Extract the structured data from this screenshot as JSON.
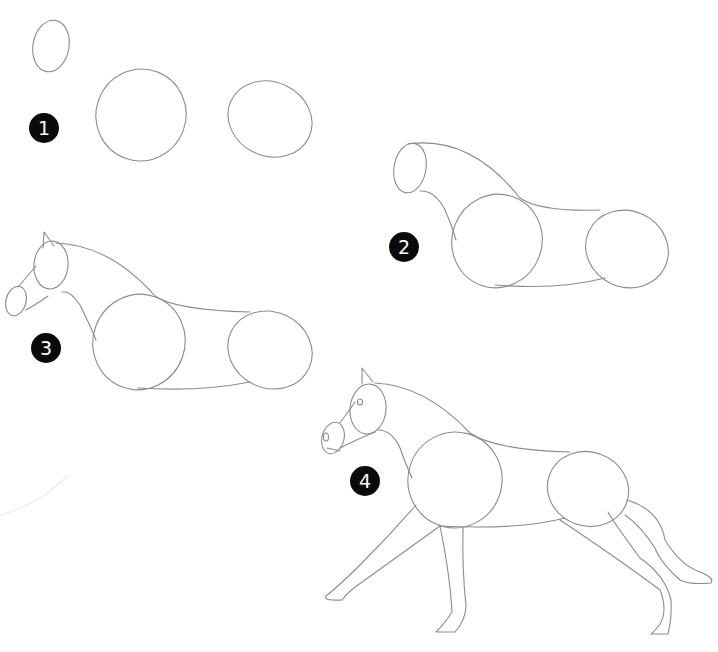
{
  "steps": [
    {
      "number": "1",
      "description": "Head and body ovals"
    },
    {
      "number": "2",
      "description": "Connect ovals with neck and belly lines"
    },
    {
      "number": "3",
      "description": "Add muzzle and ear"
    },
    {
      "number": "4",
      "description": "Add eye, nostril, legs and tail"
    }
  ],
  "colors": {
    "background": "#ffffff",
    "pencil": "#8c8c8c",
    "badge": "#0a0a0a",
    "badge_text": "#ffffff"
  }
}
